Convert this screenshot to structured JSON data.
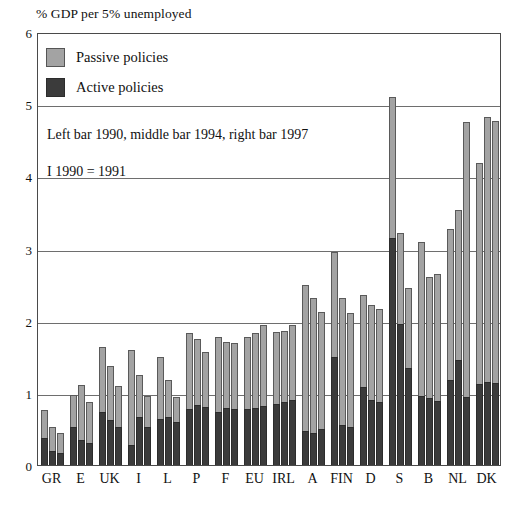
{
  "chart_data": {
    "type": "bar",
    "title": "% GDP per 5% unemployed",
    "xlabel": "",
    "ylabel": "% GDP per 5% unemployed",
    "ylim": [
      0,
      6
    ],
    "yticks": [
      "0",
      "1",
      "2",
      "3",
      "4",
      "5",
      "6"
    ],
    "grid": true,
    "legend_position": "top-left",
    "legend": [
      {
        "label": "Passive policies",
        "color": "#a3a3a3"
      },
      {
        "label": "Active policies",
        "color": "#3b3b3b"
      }
    ],
    "notes": [
      "Left bar 1990, middle bar 1994, right bar 1997",
      "I  1990 = 1991"
    ],
    "categories": [
      "GR",
      "E",
      "UK",
      "I",
      "L",
      "P",
      "F",
      "EU",
      "IRL",
      "A",
      "FIN",
      "D",
      "S",
      "B",
      "NL",
      "DK"
    ],
    "bar_years": [
      "1990",
      "1994",
      "1997"
    ],
    "series": [
      {
        "name": "Total (Active + Passive)",
        "values": [
          [
            0.76,
            0.52,
            0.45
          ],
          [
            0.97,
            1.42,
            1.17
          ],
          [
            1.12,
            1.25,
            0.88
          ],
          [
            1.64,
            1.37,
            1.09
          ],
          [
            1.6,
            1.25,
            0.96
          ],
          [
            1.49,
            1.83,
            1.56
          ],
          [
            1.78,
            1.74,
            1.7
          ],
          [
            1.77,
            1.83,
            1.94
          ],
          [
            2.5,
            2.32,
            2.12
          ],
          [
            2.95,
            2.11,
            2.16
          ],
          [
            2.36,
            5.1,
            3.22
          ],
          [
            2.45,
            3.09,
            2.61
          ],
          [
            3.27,
            3.53,
            4.75
          ],
          [
            4.18,
            4.82,
            4.77
          ],
          [
            3.27,
            3.53,
            4.75
          ],
          [
            4.18,
            4.82,
            4.77
          ]
        ]
      },
      {
        "name": "Active policies",
        "values": [
          [
            0.38,
            0.2,
            0.17
          ],
          [
            0.52,
            0.33,
            0.27
          ],
          [
            0.72,
            0.58,
            0.56
          ],
          [
            0.27,
            0.73,
            0.6
          ],
          [
            0.63,
            0.66,
            0.72
          ],
          [
            0.75,
            0.88,
            0.86
          ],
          [
            0.73,
            0.78,
            0.74
          ],
          [
            0.78,
            0.76,
            0.8
          ],
          [
            0.47,
            0.43,
            0.51
          ],
          [
            1.5,
            0.55,
            0.5
          ],
          [
            1.08,
            0.9,
            0.86
          ],
          [
            3.15,
            1.95,
            1.35
          ],
          [
            0.95,
            0.93,
            0.89
          ],
          [
            1.18,
            1.46,
            0.94
          ],
          [
            1.12,
            1.15,
            1.14
          ],
          [
            1.12,
            1.15,
            1.14
          ]
        ]
      }
    ],
    "groups": [
      {
        "category": "GR",
        "bars": [
          {
            "year": "1990",
            "total": 0.76,
            "active": 0.38
          },
          {
            "year": "1994",
            "total": 0.52,
            "active": 0.2
          },
          {
            "year": "1997",
            "total": 0.45,
            "active": 0.17
          }
        ]
      },
      {
        "category": "E",
        "bars": [
          {
            "year": "1990",
            "total": 0.97,
            "active": 0.52
          },
          {
            "year": "1994",
            "total": 1.11,
            "active": 0.35
          },
          {
            "year": "1997",
            "total": 0.87,
            "active": 0.3
          }
        ]
      },
      {
        "category": "UK",
        "bars": [
          {
            "year": "1990",
            "total": 1.64,
            "active": 0.73
          },
          {
            "year": "1994",
            "total": 1.37,
            "active": 0.62
          },
          {
            "year": "1997",
            "total": 1.09,
            "active": 0.53
          }
        ]
      },
      {
        "category": "I",
        "bars": [
          {
            "year": "1990",
            "total": 1.6,
            "active": 0.28
          },
          {
            "year": "1994",
            "total": 1.25,
            "active": 0.66
          },
          {
            "year": "1997",
            "total": 0.96,
            "active": 0.52
          }
        ]
      },
      {
        "category": "L",
        "bars": [
          {
            "year": "1990",
            "total": 1.49,
            "active": 0.64
          },
          {
            "year": "1994",
            "total": 1.18,
            "active": 0.66
          },
          {
            "year": "1997",
            "total": 0.94,
            "active": 0.6
          }
        ]
      },
      {
        "category": "P",
        "bars": [
          {
            "year": "1990",
            "total": 1.83,
            "active": 0.78
          },
          {
            "year": "1994",
            "total": 1.74,
            "active": 0.83
          },
          {
            "year": "1997",
            "total": 1.56,
            "active": 0.8
          }
        ]
      },
      {
        "category": "F",
        "bars": [
          {
            "year": "1990",
            "total": 1.77,
            "active": 0.74
          },
          {
            "year": "1994",
            "total": 1.7,
            "active": 0.79
          },
          {
            "year": "1997",
            "total": 1.69,
            "active": 0.78
          }
        ]
      },
      {
        "category": "EU",
        "bars": [
          {
            "year": "1990",
            "total": 1.77,
            "active": 0.78
          },
          {
            "year": "1994",
            "total": 1.83,
            "active": 0.79
          },
          {
            "year": "1997",
            "total": 1.94,
            "active": 0.82
          }
        ]
      },
      {
        "category": "IRL",
        "bars": [
          {
            "year": "1990",
            "total": 1.84,
            "active": 0.85
          },
          {
            "year": "1994",
            "total": 1.86,
            "active": 0.88
          },
          {
            "year": "1997",
            "total": 1.94,
            "active": 0.9
          }
        ]
      },
      {
        "category": "A",
        "bars": [
          {
            "year": "1990",
            "total": 2.5,
            "active": 0.47
          },
          {
            "year": "1994",
            "total": 2.32,
            "active": 0.44
          },
          {
            "year": "1997",
            "total": 2.12,
            "active": 0.5
          }
        ]
      },
      {
        "category": "FIN",
        "bars": [
          {
            "year": "1990",
            "total": 2.95,
            "active": 1.5
          },
          {
            "year": "1994",
            "total": 2.32,
            "active": 0.55
          },
          {
            "year": "1997",
            "total": 2.11,
            "active": 0.52
          }
        ]
      },
      {
        "category": "D",
        "bars": [
          {
            "year": "1990",
            "total": 2.36,
            "active": 1.08
          },
          {
            "year": "1994",
            "total": 2.22,
            "active": 0.9
          },
          {
            "year": "1997",
            "total": 2.16,
            "active": 0.88
          }
        ]
      },
      {
        "category": "S",
        "bars": [
          {
            "year": "1990",
            "total": 5.1,
            "active": 3.15
          },
          {
            "year": "1994",
            "total": 3.22,
            "active": 1.95
          },
          {
            "year": "1997",
            "total": 2.45,
            "active": 1.35
          }
        ]
      },
      {
        "category": "B",
        "bars": [
          {
            "year": "1990",
            "total": 3.09,
            "active": 0.95
          },
          {
            "year": "1994",
            "total": 2.61,
            "active": 0.93
          },
          {
            "year": "1997",
            "total": 2.64,
            "active": 0.89
          }
        ]
      },
      {
        "category": "NL",
        "bars": [
          {
            "year": "1990",
            "total": 3.27,
            "active": 1.18
          },
          {
            "year": "1994",
            "total": 3.53,
            "active": 1.46
          },
          {
            "year": "1997",
            "total": 4.75,
            "active": 0.94
          }
        ]
      },
      {
        "category": "DK",
        "bars": [
          {
            "year": "1990",
            "total": 4.18,
            "active": 1.12
          },
          {
            "year": "1994",
            "total": 4.82,
            "active": 1.15
          },
          {
            "year": "1997",
            "total": 4.77,
            "active": 1.14
          }
        ]
      }
    ]
  }
}
